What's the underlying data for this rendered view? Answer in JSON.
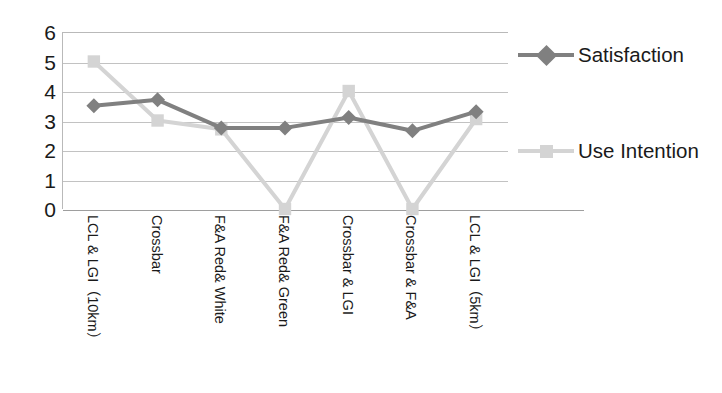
{
  "chart_data": {
    "type": "line",
    "title": "",
    "xlabel": "",
    "ylabel": "",
    "ylim": [
      0,
      6
    ],
    "yticks": [
      0,
      1,
      2,
      3,
      4,
      5,
      6
    ],
    "ytick_labels": [
      "0",
      "1",
      "2",
      "3",
      "4",
      "5",
      "6"
    ],
    "grid": true,
    "legend_position": "right",
    "categories": [
      "LCL & LGI（10km）",
      "Crossbar",
      "F&A Red& White",
      "F&A Red& Green",
      "Crossbar & LGI",
      "Crossbar & F&A",
      "LCL & LGI（5km）"
    ],
    "series": [
      {
        "name": "Satisfaction",
        "marker": "diamond",
        "color": "#808080",
        "line_color": "#808080",
        "values": [
          3.5,
          3.7,
          2.75,
          2.75,
          3.1,
          2.65,
          3.3
        ]
      },
      {
        "name": "Use Intention",
        "marker": "square",
        "color": "#d4d4d4",
        "line_color": "#d4d4d4",
        "values": [
          5.0,
          3.0,
          2.7,
          0.0,
          4.0,
          0.0,
          3.05
        ]
      }
    ]
  },
  "legend": {
    "entries": [
      {
        "label": "Satisfaction"
      },
      {
        "label": "Use Intention"
      }
    ]
  },
  "colors": {
    "satisfaction": "#808080",
    "use_intention": "#d4d4d4",
    "gridline": "#c2c2c2",
    "axis": "#9e9e9e",
    "text": "#1a1a1a"
  }
}
